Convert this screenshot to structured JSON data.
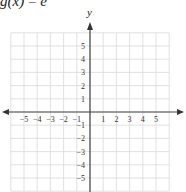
{
  "title": {
    "prefix": "g(x)",
    "equals": " = ",
    "rhs": "e"
  },
  "colors": {
    "grid": "#d9d9d9",
    "axis": "#444444",
    "text": "#333333"
  },
  "chart_data": {
    "type": "line",
    "title": "g(x) = e",
    "xlabel": "",
    "ylabel": "y",
    "xlim": [
      -6,
      6
    ],
    "ylim": [
      -6,
      6
    ],
    "grid": true,
    "x_tick_labels": [
      "-5",
      "-4",
      "-3",
      "-2",
      "-1",
      "1",
      "2",
      "3",
      "4",
      "5"
    ],
    "y_tick_labels": [
      "5",
      "4",
      "3",
      "2",
      "1",
      "-1",
      "-2",
      "-3",
      "-4",
      "-5"
    ],
    "series": []
  },
  "axes": {
    "y_label": "y",
    "x_ticks": [
      {
        "v": -5,
        "label": "−5"
      },
      {
        "v": -4,
        "label": "−4"
      },
      {
        "v": -3,
        "label": "−3"
      },
      {
        "v": -2,
        "label": "−2"
      },
      {
        "v": -1,
        "label": "−1"
      },
      {
        "v": 1,
        "label": "1"
      },
      {
        "v": 2,
        "label": "2"
      },
      {
        "v": 3,
        "label": "3"
      },
      {
        "v": 4,
        "label": "4"
      },
      {
        "v": 5,
        "label": "5"
      }
    ],
    "y_ticks": [
      {
        "v": 5,
        "label": "5"
      },
      {
        "v": 4,
        "label": "4"
      },
      {
        "v": 3,
        "label": "3"
      },
      {
        "v": 2,
        "label": "2"
      },
      {
        "v": 1,
        "label": "1"
      },
      {
        "v": -1,
        "label": "−1"
      },
      {
        "v": -2,
        "label": "−2"
      },
      {
        "v": -3,
        "label": "−3"
      },
      {
        "v": -4,
        "label": "−4"
      },
      {
        "v": -5,
        "label": "−5"
      }
    ]
  }
}
